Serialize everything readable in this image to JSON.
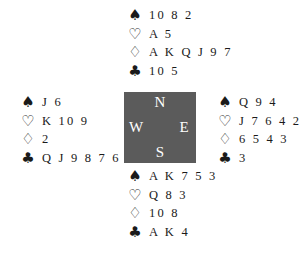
{
  "diagram": {
    "type": "bridge-deal",
    "suit_symbols": {
      "spades": "♠",
      "hearts": "♡",
      "diamonds": "♢",
      "clubs": "♣"
    },
    "compass": {
      "north": "N",
      "south": "S",
      "west": "W",
      "east": "E",
      "background_color": "#5b5b5b",
      "text_color": "#ffffff"
    },
    "hands": {
      "north": {
        "spades": "10 8 2",
        "hearts": "A 5",
        "diamonds": "A K Q J 9 7",
        "clubs": "10 5"
      },
      "west": {
        "spades": "J 6",
        "hearts": "K 10 9",
        "diamonds": "2",
        "clubs": "Q J 9 8 7 6 2"
      },
      "east": {
        "spades": "Q 9 4",
        "hearts": "J 7 6 4 2",
        "diamonds": "6 5 4 3",
        "clubs": "3"
      },
      "south": {
        "spades": "A K 7 5 3",
        "hearts": "Q 8 3",
        "diamonds": "10 8",
        "clubs": "A K 4"
      }
    }
  }
}
